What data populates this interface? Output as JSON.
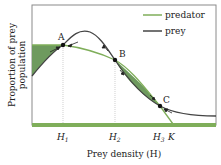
{
  "diagram": {
    "ylabel_line1": "Proportion of prey",
    "ylabel_line2": "population",
    "xlabel": "Prey density (H)",
    "legend": [
      {
        "label": "predator",
        "color": "#7fae5a"
      },
      {
        "label": "prey",
        "color": "#444444"
      }
    ],
    "points": [
      {
        "label": "A"
      },
      {
        "label": "B"
      },
      {
        "label": "C"
      }
    ],
    "ticks": [
      "H1",
      "H2",
      "H3",
      "K"
    ],
    "colors": {
      "predator": "#7fae5a",
      "prey": "#444444",
      "fill": "#6e9a5e",
      "axis_bar": "#7fae5a",
      "frame": "#666666"
    }
  }
}
